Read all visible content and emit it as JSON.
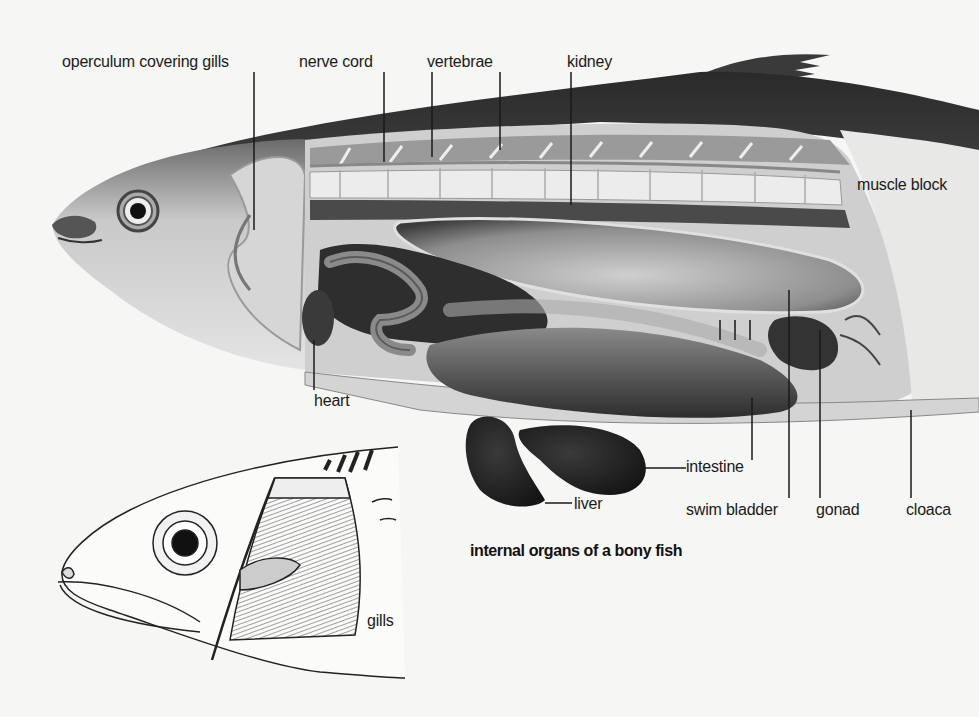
{
  "diagram": {
    "caption": "internal organs of a bony fish",
    "labels": {
      "operculum": "operculum covering gills",
      "nerve_cord": "nerve cord",
      "vertebrae": "vertebrae",
      "kidney": "kidney",
      "muscle_block": "muscle block",
      "heart": "heart",
      "liver": "liver",
      "intestine": "intestine",
      "swim_bladder": "swim bladder",
      "gonad": "gonad",
      "cloaca": "cloaca",
      "gills": "gills"
    }
  }
}
